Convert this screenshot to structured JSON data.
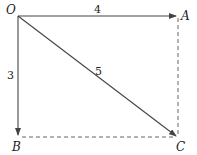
{
  "diagram": {
    "points": {
      "O": {
        "label": "O",
        "x": 18,
        "y": 16
      },
      "A": {
        "label": "A",
        "x": 178,
        "y": 16
      },
      "B": {
        "label": "B",
        "x": 18,
        "y": 137
      },
      "C": {
        "label": "C",
        "x": 178,
        "y": 137
      }
    },
    "vectors": [
      {
        "from": "O",
        "to": "A",
        "length_label": "4"
      },
      {
        "from": "O",
        "to": "B",
        "length_label": "3"
      },
      {
        "from": "O",
        "to": "C",
        "length_label": "5"
      }
    ],
    "dashed_lines": [
      {
        "from": "A",
        "to": "C"
      },
      {
        "from": "B",
        "to": "C"
      }
    ],
    "colors": {
      "line": "#444444",
      "text": "#222222"
    }
  }
}
